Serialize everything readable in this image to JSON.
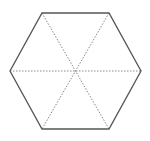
{
  "diagram": {
    "shape": "regular-hexagon",
    "vertices": [
      [
        42,
        13
      ],
      [
        109,
        13
      ],
      [
        141,
        71
      ],
      [
        109,
        129
      ],
      [
        42,
        129
      ],
      [
        10,
        71
      ]
    ],
    "center": [
      76,
      71
    ],
    "outline_color": "#555555",
    "outline_width": 1.3,
    "divider_color": "#888888",
    "divider_width": 1,
    "divider_dash": "1.5,1.5",
    "dividers": [
      {
        "from": [
          42,
          13
        ],
        "to": [
          109,
          129
        ]
      },
      {
        "from": [
          109,
          13
        ],
        "to": [
          42,
          129
        ]
      },
      {
        "from": [
          10,
          71
        ],
        "to": [
          141,
          71
        ]
      }
    ]
  }
}
